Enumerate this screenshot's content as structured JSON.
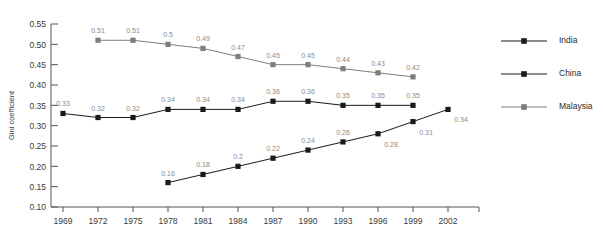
{
  "chart_data": {
    "type": "line",
    "title": "",
    "xlabel": "",
    "ylabel": "Gini coefficient",
    "x": [
      1969,
      1972,
      1975,
      1978,
      1981,
      1984,
      1987,
      1990,
      1993,
      1996,
      1999,
      2002
    ],
    "xtick_labels": [
      "1969",
      "1972",
      "1975",
      "1978",
      "1981",
      "1984",
      "1987",
      "1990",
      "1993",
      "1996",
      "1999",
      "2002"
    ],
    "ytick_labels": [
      "0.10",
      "0.15",
      "0.20",
      "0.25",
      "0.30",
      "0.35",
      "0.40",
      "0.45",
      "0.50",
      "0.55"
    ],
    "yticks": [
      0.1,
      0.15,
      0.2,
      0.25,
      0.3,
      0.35,
      0.4,
      0.45,
      0.5,
      0.55
    ],
    "ylim": [
      0.1,
      0.55
    ],
    "grid": false,
    "legend_position": "right",
    "series": [
      {
        "name": "India",
        "color": "#1a1a1a",
        "marker": "square",
        "points": [
          {
            "x": 1969,
            "y": 0.33,
            "label": "0.33",
            "label_pos": "above"
          },
          {
            "x": 1972,
            "y": 0.32,
            "label": "0.32",
            "label_pos": "above"
          },
          {
            "x": 1975,
            "y": 0.32,
            "label": "0.32",
            "label_pos": "above"
          },
          {
            "x": 1978,
            "y": 0.34,
            "label": "0.34",
            "label_pos": "above"
          },
          {
            "x": 1981,
            "y": 0.34,
            "label": "0.34",
            "label_pos": "above"
          },
          {
            "x": 1984,
            "y": 0.34,
            "label": "0.34",
            "label_pos": "above"
          },
          {
            "x": 1987,
            "y": 0.36,
            "label": "0.36",
            "label_pos": "above"
          },
          {
            "x": 1990,
            "y": 0.36,
            "label": "0.36",
            "label_pos": "above"
          },
          {
            "x": 1993,
            "y": 0.35,
            "label": "0.35",
            "label_pos": "above"
          },
          {
            "x": 1996,
            "y": 0.35,
            "label": "0.35",
            "label_pos": "above"
          },
          {
            "x": 1999,
            "y": 0.35,
            "label": "0.35",
            "label_pos": "above"
          }
        ]
      },
      {
        "name": "China",
        "color": "#1a1a1a",
        "marker": "square",
        "points": [
          {
            "x": 1978,
            "y": 0.16,
            "label": "0.16",
            "label_pos": "above"
          },
          {
            "x": 1981,
            "y": 0.18,
            "label": "0.18",
            "label_pos": "above"
          },
          {
            "x": 1984,
            "y": 0.2,
            "label": "0.2",
            "label_pos": "above"
          },
          {
            "x": 1987,
            "y": 0.22,
            "label": "0.22",
            "label_pos": "above"
          },
          {
            "x": 1990,
            "y": 0.24,
            "label": "0.24",
            "label_pos": "above"
          },
          {
            "x": 1993,
            "y": 0.26,
            "label": "0.26",
            "label_pos": "above"
          },
          {
            "x": 1996,
            "y": 0.28,
            "label": "0.28",
            "label_pos": "below"
          },
          {
            "x": 1999,
            "y": 0.31,
            "label": "0.31",
            "label_pos": "below"
          },
          {
            "x": 2002,
            "y": 0.34,
            "label": "0.34",
            "label_pos": "below"
          }
        ]
      },
      {
        "name": "Malaysia",
        "color": "#7d7d7d",
        "marker": "square",
        "points": [
          {
            "x": 1972,
            "y": 0.51,
            "label": "0.51",
            "label_pos": "above"
          },
          {
            "x": 1975,
            "y": 0.51,
            "label": "0.51",
            "label_pos": "above"
          },
          {
            "x": 1978,
            "y": 0.5,
            "label": "0.5",
            "label_pos": "above"
          },
          {
            "x": 1981,
            "y": 0.49,
            "label": "0.49",
            "label_pos": "above"
          },
          {
            "x": 1984,
            "y": 0.47,
            "label": "0.47",
            "label_pos": "above"
          },
          {
            "x": 1987,
            "y": 0.45,
            "label": "0.45",
            "label_pos": "above"
          },
          {
            "x": 1990,
            "y": 0.45,
            "label": "0.45",
            "label_pos": "above"
          },
          {
            "x": 1993,
            "y": 0.44,
            "label": "0.44",
            "label_pos": "above"
          },
          {
            "x": 1996,
            "y": 0.43,
            "label": "0.43",
            "label_pos": "above"
          },
          {
            "x": 1999,
            "y": 0.42,
            "label": "0.42",
            "label_pos": "above"
          }
        ]
      }
    ],
    "legend": [
      {
        "label": "India",
        "color": "#1a1a1a"
      },
      {
        "label": "China",
        "color": "#1a1a1a"
      },
      {
        "label": "Malaysia",
        "color": "#7d7d7d"
      }
    ]
  }
}
